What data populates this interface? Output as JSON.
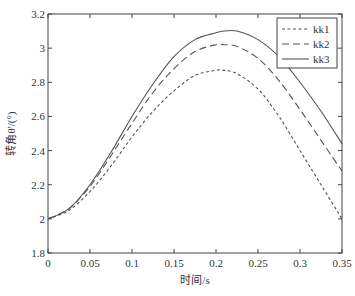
{
  "chart_data": {
    "type": "line",
    "title": "",
    "xlabel": "时间/s",
    "ylabel": "转角θ'/(°)",
    "xlim": [
      0,
      0.35
    ],
    "ylim": [
      1.8,
      3.2
    ],
    "xticks": [
      "0",
      "0.05",
      "0.1",
      "0.15",
      "0.2",
      "0.25",
      "0.3",
      "0.35"
    ],
    "yticks": [
      "1.8",
      "2",
      "2.2",
      "2.4",
      "2.6",
      "2.8",
      "3",
      "3.2"
    ],
    "grid": false,
    "legend_position": "upper right",
    "x": [
      0,
      0.025,
      0.05,
      0.075,
      0.1,
      0.125,
      0.15,
      0.175,
      0.2,
      0.21,
      0.225,
      0.25,
      0.275,
      0.3,
      0.325,
      0.35
    ],
    "series": [
      {
        "name": "kk1",
        "style": "dotted",
        "values": [
          2.0,
          2.05,
          2.16,
          2.31,
          2.48,
          2.63,
          2.75,
          2.84,
          2.87,
          2.87,
          2.85,
          2.76,
          2.6,
          2.4,
          2.2,
          2.0
        ]
      },
      {
        "name": "kk2",
        "style": "dashed",
        "values": [
          2.0,
          2.06,
          2.19,
          2.37,
          2.56,
          2.74,
          2.88,
          2.98,
          3.02,
          3.02,
          3.01,
          2.94,
          2.81,
          2.64,
          2.46,
          2.28
        ]
      },
      {
        "name": "kk3",
        "style": "solid",
        "values": [
          2.0,
          2.06,
          2.2,
          2.39,
          2.6,
          2.79,
          2.95,
          3.05,
          3.09,
          3.1,
          3.1,
          3.05,
          2.95,
          2.8,
          2.63,
          2.44
        ]
      }
    ]
  }
}
